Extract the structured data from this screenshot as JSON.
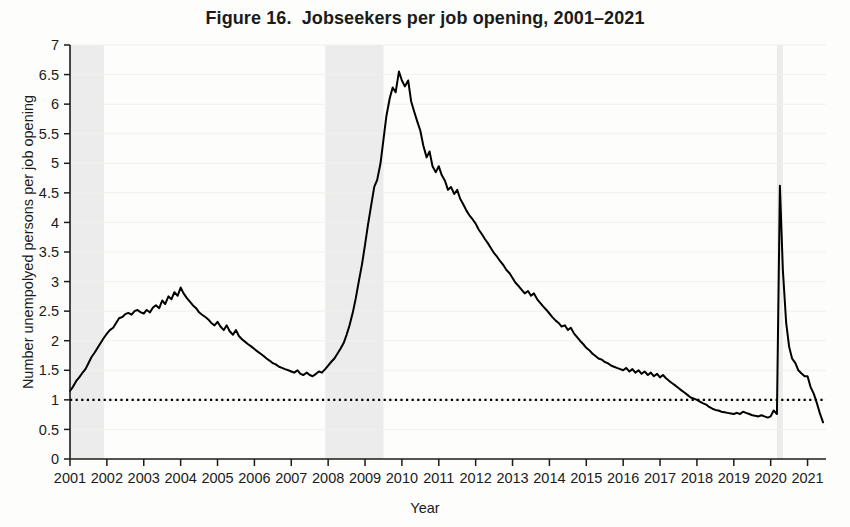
{
  "figure": {
    "title": "Figure 16.  Jobseekers per job opening, 2001–2021",
    "ylabel": "Number unempolyed persons per job opening",
    "xlabel": "Year"
  },
  "colors": {
    "line": "#000000",
    "recession_band": "#ececec",
    "gridline": "#f0f0ee",
    "axis": "#1b1b1b",
    "background": "#fdfdfb",
    "reference_line": "#000000"
  },
  "chart_data": {
    "type": "line",
    "title": "Figure 16.  Jobseekers per job opening, 2001–2021",
    "xlabel": "Year",
    "ylabel": "Number unempolyed persons per job opening",
    "xlim": [
      2001.0,
      2021.5
    ],
    "ylim": [
      0,
      7
    ],
    "yticks": [
      0,
      0.5,
      1,
      1.5,
      2,
      2.5,
      3,
      3.5,
      4,
      4.5,
      5,
      5.5,
      6,
      6.5,
      7
    ],
    "ytick_labels": [
      "0",
      "0.5",
      "1",
      "1.5",
      "2",
      "2.5",
      "3",
      "3.5",
      "4",
      "4.5",
      "5",
      "5.5",
      "6",
      "6.5",
      "7"
    ],
    "xticks": [
      2001,
      2002,
      2003,
      2004,
      2005,
      2006,
      2007,
      2008,
      2009,
      2010,
      2011,
      2012,
      2013,
      2014,
      2015,
      2016,
      2017,
      2018,
      2019,
      2020,
      2021
    ],
    "xtick_labels": [
      "2001",
      "2002",
      "2003",
      "2004",
      "2005",
      "2006",
      "2007",
      "2008",
      "2009",
      "2010",
      "2011",
      "2012",
      "2013",
      "2014",
      "2015",
      "2016",
      "2017",
      "2018",
      "2019",
      "2020",
      "2021"
    ],
    "grid": true,
    "legend": "none",
    "reference_lines": [
      {
        "name": "one-to-one",
        "y": 1.0,
        "style": "dotted"
      }
    ],
    "shaded_regions": [
      {
        "name": "recession-2001",
        "x0": 2001.0,
        "x1": 2001.92,
        "label": ""
      },
      {
        "name": "recession-2007-2009",
        "x0": 2007.92,
        "x1": 2009.5,
        "label": ""
      },
      {
        "name": "recession-2020",
        "x0": 2020.17,
        "x1": 2020.33,
        "label": ""
      }
    ],
    "series": [
      {
        "name": "Jobseekers per job opening",
        "x": [
          2001.0,
          2001.08,
          2001.17,
          2001.25,
          2001.33,
          2001.42,
          2001.5,
          2001.58,
          2001.67,
          2001.75,
          2001.83,
          2001.92,
          2002.0,
          2002.08,
          2002.17,
          2002.25,
          2002.33,
          2002.42,
          2002.5,
          2002.58,
          2002.67,
          2002.75,
          2002.83,
          2002.92,
          2003.0,
          2003.08,
          2003.17,
          2003.25,
          2003.33,
          2003.42,
          2003.5,
          2003.58,
          2003.67,
          2003.75,
          2003.83,
          2003.92,
          2004.0,
          2004.08,
          2004.17,
          2004.25,
          2004.33,
          2004.42,
          2004.5,
          2004.58,
          2004.67,
          2004.75,
          2004.83,
          2004.92,
          2005.0,
          2005.08,
          2005.17,
          2005.25,
          2005.33,
          2005.42,
          2005.5,
          2005.58,
          2005.67,
          2005.75,
          2005.83,
          2005.92,
          2006.0,
          2006.08,
          2006.17,
          2006.25,
          2006.33,
          2006.42,
          2006.5,
          2006.58,
          2006.67,
          2006.75,
          2006.83,
          2006.92,
          2007.0,
          2007.08,
          2007.17,
          2007.25,
          2007.33,
          2007.42,
          2007.5,
          2007.58,
          2007.67,
          2007.75,
          2007.83,
          2007.92,
          2008.0,
          2008.08,
          2008.17,
          2008.25,
          2008.33,
          2008.42,
          2008.5,
          2008.58,
          2008.67,
          2008.75,
          2008.83,
          2008.92,
          2009.0,
          2009.08,
          2009.17,
          2009.25,
          2009.33,
          2009.42,
          2009.5,
          2009.58,
          2009.67,
          2009.75,
          2009.83,
          2009.92,
          2010.0,
          2010.08,
          2010.17,
          2010.25,
          2010.33,
          2010.42,
          2010.5,
          2010.58,
          2010.67,
          2010.75,
          2010.83,
          2010.92,
          2011.0,
          2011.08,
          2011.17,
          2011.25,
          2011.33,
          2011.42,
          2011.5,
          2011.58,
          2011.67,
          2011.75,
          2011.83,
          2011.92,
          2012.0,
          2012.08,
          2012.17,
          2012.25,
          2012.33,
          2012.42,
          2012.5,
          2012.58,
          2012.67,
          2012.75,
          2012.83,
          2012.92,
          2013.0,
          2013.08,
          2013.17,
          2013.25,
          2013.33,
          2013.42,
          2013.5,
          2013.58,
          2013.67,
          2013.75,
          2013.83,
          2013.92,
          2014.0,
          2014.08,
          2014.17,
          2014.25,
          2014.33,
          2014.42,
          2014.5,
          2014.58,
          2014.67,
          2014.75,
          2014.83,
          2014.92,
          2015.0,
          2015.08,
          2015.17,
          2015.25,
          2015.33,
          2015.42,
          2015.5,
          2015.58,
          2015.67,
          2015.75,
          2015.83,
          2015.92,
          2016.0,
          2016.08,
          2016.17,
          2016.25,
          2016.33,
          2016.42,
          2016.5,
          2016.58,
          2016.67,
          2016.75,
          2016.83,
          2016.92,
          2017.0,
          2017.08,
          2017.17,
          2017.25,
          2017.33,
          2017.42,
          2017.5,
          2017.58,
          2017.67,
          2017.75,
          2017.83,
          2017.92,
          2018.0,
          2018.08,
          2018.17,
          2018.25,
          2018.33,
          2018.42,
          2018.5,
          2018.58,
          2018.67,
          2018.75,
          2018.83,
          2018.92,
          2019.0,
          2019.08,
          2019.17,
          2019.25,
          2019.33,
          2019.42,
          2019.5,
          2019.58,
          2019.67,
          2019.75,
          2019.83,
          2019.92,
          2020.0,
          2020.08,
          2020.17,
          2020.25,
          2020.33,
          2020.42,
          2020.5,
          2020.58,
          2020.67,
          2020.75,
          2020.83,
          2020.92,
          2021.0,
          2021.08,
          2021.17,
          2021.25,
          2021.33,
          2021.42
        ],
        "y": [
          1.15,
          1.22,
          1.32,
          1.38,
          1.45,
          1.52,
          1.62,
          1.72,
          1.8,
          1.88,
          1.96,
          2.05,
          2.12,
          2.18,
          2.22,
          2.3,
          2.38,
          2.4,
          2.45,
          2.47,
          2.44,
          2.5,
          2.52,
          2.48,
          2.46,
          2.52,
          2.48,
          2.56,
          2.6,
          2.55,
          2.68,
          2.62,
          2.75,
          2.7,
          2.82,
          2.76,
          2.9,
          2.8,
          2.72,
          2.66,
          2.6,
          2.55,
          2.48,
          2.44,
          2.4,
          2.36,
          2.3,
          2.26,
          2.32,
          2.24,
          2.18,
          2.26,
          2.16,
          2.1,
          2.18,
          2.08,
          2.02,
          1.98,
          1.94,
          1.9,
          1.86,
          1.82,
          1.78,
          1.74,
          1.7,
          1.66,
          1.62,
          1.6,
          1.56,
          1.54,
          1.52,
          1.5,
          1.48,
          1.46,
          1.5,
          1.44,
          1.42,
          1.46,
          1.42,
          1.4,
          1.44,
          1.48,
          1.46,
          1.52,
          1.58,
          1.64,
          1.7,
          1.78,
          1.86,
          1.96,
          2.1,
          2.26,
          2.48,
          2.72,
          3.0,
          3.3,
          3.62,
          3.96,
          4.3,
          4.6,
          4.72,
          5.0,
          5.4,
          5.8,
          6.1,
          6.28,
          6.2,
          6.55,
          6.4,
          6.3,
          6.4,
          6.05,
          5.88,
          5.7,
          5.55,
          5.3,
          5.1,
          5.2,
          4.95,
          4.85,
          4.95,
          4.8,
          4.7,
          4.55,
          4.6,
          4.48,
          4.55,
          4.4,
          4.3,
          4.2,
          4.12,
          4.05,
          3.98,
          3.88,
          3.8,
          3.72,
          3.65,
          3.56,
          3.48,
          3.42,
          3.34,
          3.28,
          3.2,
          3.14,
          3.06,
          2.98,
          2.92,
          2.86,
          2.8,
          2.84,
          2.76,
          2.8,
          2.7,
          2.64,
          2.58,
          2.52,
          2.46,
          2.4,
          2.34,
          2.3,
          2.24,
          2.26,
          2.18,
          2.22,
          2.12,
          2.06,
          2.0,
          1.94,
          1.88,
          1.84,
          1.78,
          1.74,
          1.7,
          1.68,
          1.64,
          1.62,
          1.58,
          1.56,
          1.54,
          1.52,
          1.5,
          1.54,
          1.48,
          1.52,
          1.46,
          1.5,
          1.44,
          1.48,
          1.42,
          1.46,
          1.4,
          1.44,
          1.38,
          1.42,
          1.36,
          1.32,
          1.28,
          1.24,
          1.2,
          1.16,
          1.12,
          1.08,
          1.04,
          1.02,
          1.0,
          0.97,
          0.94,
          0.92,
          0.88,
          0.85,
          0.83,
          0.82,
          0.8,
          0.79,
          0.78,
          0.77,
          0.76,
          0.78,
          0.76,
          0.8,
          0.78,
          0.76,
          0.74,
          0.73,
          0.72,
          0.74,
          0.72,
          0.7,
          0.72,
          0.82,
          0.76,
          4.62,
          3.2,
          2.3,
          1.9,
          1.7,
          1.62,
          1.5,
          1.45,
          1.4,
          1.4,
          1.22,
          1.1,
          0.95,
          0.78,
          0.62
        ]
      }
    ]
  }
}
